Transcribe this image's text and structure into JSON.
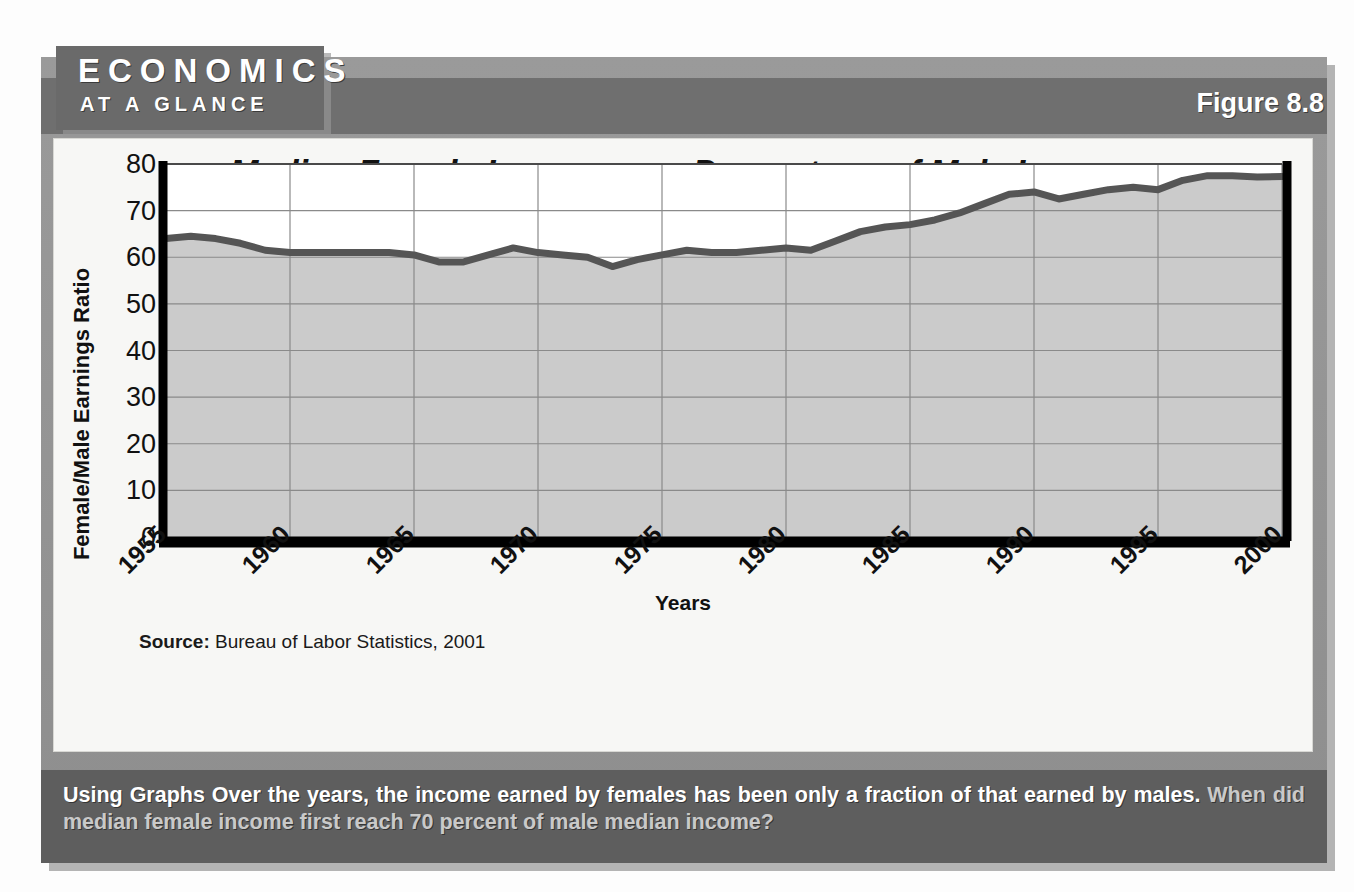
{
  "header": {
    "brand_line1": "ECONOMICS",
    "brand_line2": "AT A GLANCE",
    "figure_label": "Figure 8.8"
  },
  "chart_data": {
    "type": "area",
    "title": "Median Female Income as a Percentage of Male Income",
    "xlabel": "Years",
    "ylabel": "Female/Male Earnings Ratio",
    "ylim": [
      0,
      80
    ],
    "xlim": [
      1955,
      2000
    ],
    "yticks": [
      80,
      70,
      60,
      50,
      40,
      30,
      20,
      10,
      0
    ],
    "xticks": [
      "1955",
      "1960",
      "1965",
      "1970",
      "1975",
      "1980",
      "1985",
      "1990",
      "1995",
      "2000"
    ],
    "grid": true,
    "legend": "none",
    "series": [
      {
        "name": "Female/Male Earnings Ratio",
        "x": [
          1955,
          1956,
          1957,
          1958,
          1959,
          1960,
          1961,
          1962,
          1963,
          1964,
          1965,
          1966,
          1967,
          1968,
          1969,
          1970,
          1971,
          1972,
          1973,
          1974,
          1975,
          1976,
          1977,
          1978,
          1979,
          1980,
          1981,
          1982,
          1983,
          1984,
          1985,
          1986,
          1987,
          1988,
          1989,
          1990,
          1991,
          1992,
          1993,
          1994,
          1995,
          1996,
          1997,
          1998,
          1999,
          2000
        ],
        "values": [
          64.0,
          64.5,
          64.0,
          63.0,
          61.5,
          61.0,
          61.0,
          61.0,
          61.0,
          61.0,
          60.5,
          59.0,
          59.0,
          60.5,
          62.0,
          61.0,
          60.5,
          60.0,
          58.0,
          59.5,
          60.5,
          61.5,
          61.0,
          61.0,
          61.5,
          62.0,
          61.5,
          63.5,
          65.5,
          66.5,
          67.0,
          68.0,
          69.5,
          71.5,
          73.5,
          74.0,
          72.5,
          73.5,
          74.5,
          75.0,
          74.5,
          76.5,
          77.5,
          77.5,
          77.2,
          77.3
        ]
      }
    ],
    "colors": {
      "line": "#555555",
      "fill": "#cbcbcb",
      "axis": "#000000",
      "grid": "#8a8a8a"
    }
  },
  "source": {
    "label": "Source:",
    "text": "Bureau of Labor Statistics, 2001"
  },
  "caption": {
    "lead": "Using Graphs",
    "body": "Over the years, the income earned by females has been only a fraction of that earned by males.",
    "question": "When did median female income first reach 70 percent of male median income?"
  }
}
